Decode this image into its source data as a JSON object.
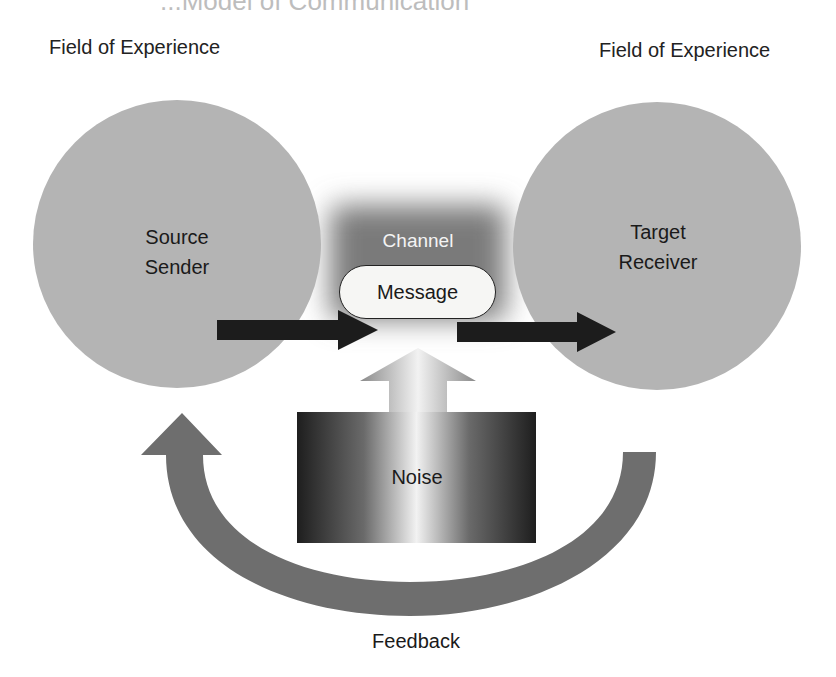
{
  "title": "...Model of Communication",
  "labels": {
    "field_left": "Field of Experience",
    "field_right": "Field of Experience",
    "source_line1": "Source",
    "source_line2": "Sender",
    "target_line1": "Target",
    "target_line2": "Receiver",
    "channel": "Channel",
    "message": "Message",
    "noise": "Noise",
    "feedback": "Feedback"
  },
  "colors": {
    "circle_fill": "#b4b4b4",
    "arrow_fill": "#1c1c1c",
    "feedback_fill": "#6e6e6e",
    "channel_dark": "#7a7a7a",
    "noise_dark": "#1e1e1e",
    "noise_light": "#f2f2f2"
  }
}
